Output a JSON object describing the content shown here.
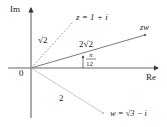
{
  "diagram": {
    "type": "complex-plane-multiplication",
    "axes": {
      "x_label": "Re",
      "y_label": "Im",
      "origin_label": "0"
    },
    "vectors": [
      {
        "name": "z",
        "label": "z = 1 + i",
        "modulus_label": "√2",
        "style": "dashed",
        "color": "#9a9a9a"
      },
      {
        "name": "zw",
        "label": "zw",
        "modulus_label": "2√2",
        "style": "solid",
        "color": "#7a7a7a"
      },
      {
        "name": "w",
        "label": "w = √3 − i",
        "modulus_label": "2",
        "style": "solid",
        "color": "#c8c8c8"
      }
    ],
    "angle": {
      "label_numerator": "π",
      "label_denominator": "12"
    },
    "colors": {
      "axis": "#333333",
      "text": "#222222"
    }
  }
}
